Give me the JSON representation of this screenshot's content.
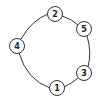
{
  "diagram": {
    "type": "cycle",
    "stroke_color": "#333333",
    "fill_color": "#ffffff",
    "ring": {
      "cx": 53,
      "cy": 52,
      "r": 37
    },
    "nodes": [
      {
        "id": "2",
        "label": "2",
        "x": 55,
        "y": 14
      },
      {
        "id": "5",
        "label": "5",
        "x": 84,
        "y": 29
      },
      {
        "id": "3",
        "label": "3",
        "x": 84,
        "y": 73
      },
      {
        "id": "1",
        "label": "1",
        "x": 57,
        "y": 88
      },
      {
        "id": "4",
        "label": "4",
        "x": 17,
        "y": 46
      }
    ],
    "node_radius": 7.5
  }
}
